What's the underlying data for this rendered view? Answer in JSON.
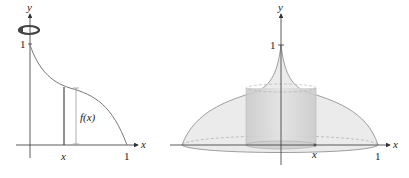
{
  "left_plot": {
    "y_axis_label": "y",
    "x_axis_label": "x",
    "y_tick_label": "1",
    "x_tick_label": "1",
    "x_marker_label": "x",
    "height_label": "f(x)",
    "rotation_icon": "rotation-arrow-icon"
  },
  "right_plot": {
    "y_axis_label": "y",
    "x_axis_label": "x",
    "y_tick_label": "1",
    "x_tick_label": "1",
    "x_marker_label": "x"
  },
  "colors": {
    "axis": "#333333",
    "curve": "#555555",
    "surface_fill": "#e6e6e6",
    "cylinder_fill": "#d0d0d0",
    "bracket": "#999999"
  }
}
